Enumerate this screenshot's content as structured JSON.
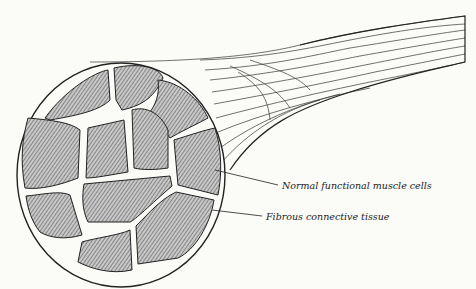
{
  "figure": {
    "labels": [
      {
        "text": "Normal functional muscle cells",
        "x": 282,
        "y": 188
      },
      {
        "text": "Fibrous connective tissue",
        "x": 266,
        "y": 219
      }
    ],
    "colors": {
      "ink": "#2a2a2a",
      "paper": "#fbfbf8",
      "fascicle": "#9a9a9a"
    }
  }
}
